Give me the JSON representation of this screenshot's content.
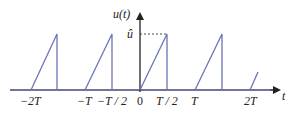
{
  "diagram": {
    "y_axis_label": "u(t)",
    "x_axis_label": "t",
    "peak_label": "û",
    "tick_labels": [
      {
        "id": "minus_2T",
        "text": "−2T"
      },
      {
        "id": "minus_T",
        "text": "−T"
      },
      {
        "id": "minus_T_half",
        "text": "−T / 2"
      },
      {
        "id": "zero",
        "text": "0"
      },
      {
        "id": "T_half",
        "text": "T / 2"
      },
      {
        "id": "T",
        "text": "T"
      },
      {
        "id": "two_T",
        "text": "2T"
      }
    ],
    "colors": {
      "signal": "#6b74b8",
      "axis": "#222222",
      "baseline": "#7a7fb0",
      "dashed": "#333333"
    }
  }
}
